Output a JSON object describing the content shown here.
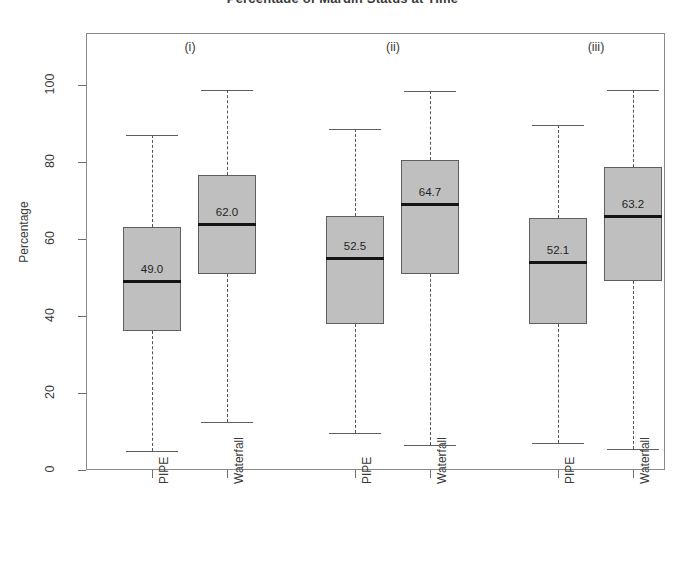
{
  "chart_data": {
    "type": "boxplot",
    "title": "Percentage of Margin Status at Time",
    "ylabel": "Percentage",
    "xlabel": "",
    "ylim": [
      0,
      105
    ],
    "yticks": [
      0,
      20,
      40,
      60,
      80,
      100
    ],
    "ytick_labels": [
      "0",
      "20",
      "40",
      "60",
      "80",
      "100"
    ],
    "grid": false,
    "legend": "none",
    "group_labels": [
      "(i)",
      "(ii)",
      "(iii)"
    ],
    "categories": [
      "PIPE",
      "Waterfall",
      "PIPE",
      "Waterfall",
      "PIPE",
      "Waterfall"
    ],
    "boxes": [
      {
        "group": "(i)",
        "category": "PIPE",
        "whisker_low": 5.0,
        "q1": 36.0,
        "median": 49.0,
        "q3": 63.0,
        "whisker_high": 87.0,
        "median_label": "49.0"
      },
      {
        "group": "(i)",
        "category": "Waterfall",
        "whisker_low": 12.5,
        "q1": 51.0,
        "median": 64.0,
        "q3": 76.5,
        "whisker_high": 98.8,
        "median_label": "62.0"
      },
      {
        "group": "(ii)",
        "category": "PIPE",
        "whisker_low": 9.5,
        "q1": 38.0,
        "median": 55.0,
        "q3": 66.0,
        "whisker_high": 88.5,
        "median_label": "52.5"
      },
      {
        "group": "(ii)",
        "category": "Waterfall",
        "whisker_low": 6.5,
        "q1": 51.0,
        "median": 69.0,
        "q3": 80.5,
        "whisker_high": 98.5,
        "median_label": "64.7"
      },
      {
        "group": "(iii)",
        "category": "PIPE",
        "whisker_low": 7.0,
        "q1": 38.0,
        "median": 54.0,
        "q3": 65.5,
        "whisker_high": 89.5,
        "median_label": "52.1"
      },
      {
        "group": "(iii)",
        "category": "Waterfall",
        "whisker_low": 5.5,
        "q1": 49.0,
        "median": 66.0,
        "q3": 78.8,
        "whisker_high": 98.8,
        "median_label": "63.2"
      }
    ],
    "colors": {
      "box_fill": "#bfbfbf",
      "box_border": "#5f5f5f",
      "median": "#141414",
      "whisker": "#555555",
      "axis": "#6f6f6f",
      "text": "#3a3a3a",
      "background": "#ffffff"
    }
  }
}
